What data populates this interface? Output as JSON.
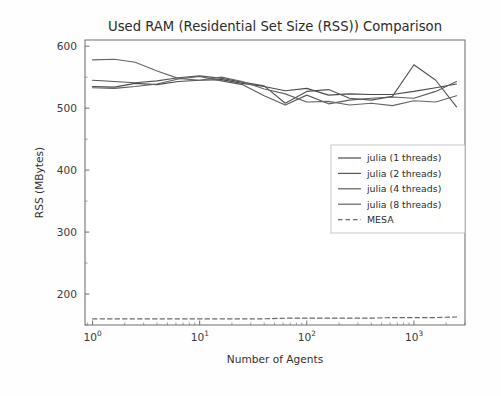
{
  "chart_data": {
    "type": "line",
    "title": "Used RAM (Residential Set Size (RSS)) Comparison",
    "xlabel": "Number of Agents",
    "ylabel": "RSS (MBytes)",
    "xscale": "log",
    "yscale": "linear",
    "xlim": [
      0.85,
      3000
    ],
    "ylim": [
      150,
      610
    ],
    "xticks": [
      1,
      10,
      100,
      1000
    ],
    "xticklabels": [
      "10^0",
      "10^1",
      "10^2",
      "10^3"
    ],
    "yticks": [
      200,
      300,
      400,
      500,
      600
    ],
    "yticklabels": [
      "200",
      "300",
      "400",
      "500",
      "600"
    ],
    "grid": false,
    "legend_position": "center-right",
    "series": [
      {
        "name": "julia (1 threads)",
        "color": "#4a4a4a",
        "dash": "none",
        "x": [
          1,
          1.6,
          2.5,
          4,
          6.3,
          10,
          16,
          25,
          40,
          63,
          100,
          160,
          250,
          400,
          630,
          1000,
          1600,
          2500
        ],
        "y": [
          535,
          534,
          540,
          538,
          543,
          545,
          546,
          540,
          535,
          528,
          532,
          521,
          523,
          522,
          522,
          527,
          533,
          539
        ]
      },
      {
        "name": "julia (2 threads)",
        "color": "#555555",
        "dash": "none",
        "x": [
          1,
          1.6,
          2.5,
          4,
          6.3,
          10,
          16,
          25,
          40,
          63,
          100,
          160,
          250,
          400,
          630,
          1000,
          1600,
          2500
        ],
        "y": [
          545,
          543,
          541,
          544,
          549,
          552,
          548,
          542,
          536,
          508,
          527,
          530,
          516,
          513,
          519,
          570,
          545,
          502
        ]
      },
      {
        "name": "julia (4 threads)",
        "color": "#5e5e5e",
        "dash": "none",
        "x": [
          1,
          1.6,
          2.5,
          4,
          6.3,
          10,
          16,
          25,
          40,
          63,
          100,
          160,
          250,
          400,
          630,
          1000,
          1600,
          2500
        ],
        "y": [
          533,
          532,
          535,
          539,
          547,
          551,
          544,
          538,
          520,
          505,
          521,
          507,
          513,
          516,
          518,
          516,
          527,
          543
        ]
      },
      {
        "name": "julia (8 threads)",
        "color": "#656565",
        "dash": "none",
        "x": [
          1,
          1.6,
          2.5,
          4,
          6.3,
          10,
          16,
          25,
          40,
          63,
          100,
          160,
          250,
          400,
          630,
          1000,
          1600,
          2500
        ],
        "y": [
          578,
          579,
          574,
          560,
          548,
          545,
          550,
          543,
          531,
          523,
          510,
          511,
          505,
          508,
          504,
          512,
          510,
          520
        ]
      },
      {
        "name": "MESA",
        "color": "#6a6a6a",
        "dash": "dashed",
        "x": [
          1,
          1.6,
          2.5,
          4,
          6.3,
          10,
          16,
          25,
          40,
          63,
          100,
          160,
          250,
          400,
          630,
          1000,
          1600,
          2500
        ],
        "y": [
          160,
          160,
          160,
          160,
          160,
          160,
          160,
          160,
          160,
          161,
          161,
          161,
          161,
          161,
          162,
          162,
          162,
          163
        ]
      }
    ]
  },
  "legend": {
    "items": [
      {
        "label": "julia (1 threads)"
      },
      {
        "label": "julia (2 threads)"
      },
      {
        "label": "julia (4 threads)"
      },
      {
        "label": "julia (8 threads)"
      },
      {
        "label": "MESA"
      }
    ]
  }
}
